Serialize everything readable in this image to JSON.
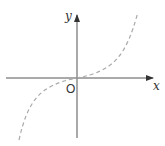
{
  "diagram": {
    "type": "function-graph",
    "axes": {
      "x_label": "x",
      "y_label": "y",
      "origin_label": "O",
      "axis_color": "#444444"
    },
    "curve": {
      "description": "increasing cubic-like curve through origin",
      "style": "dashed",
      "color": "#aaaaaa"
    }
  }
}
